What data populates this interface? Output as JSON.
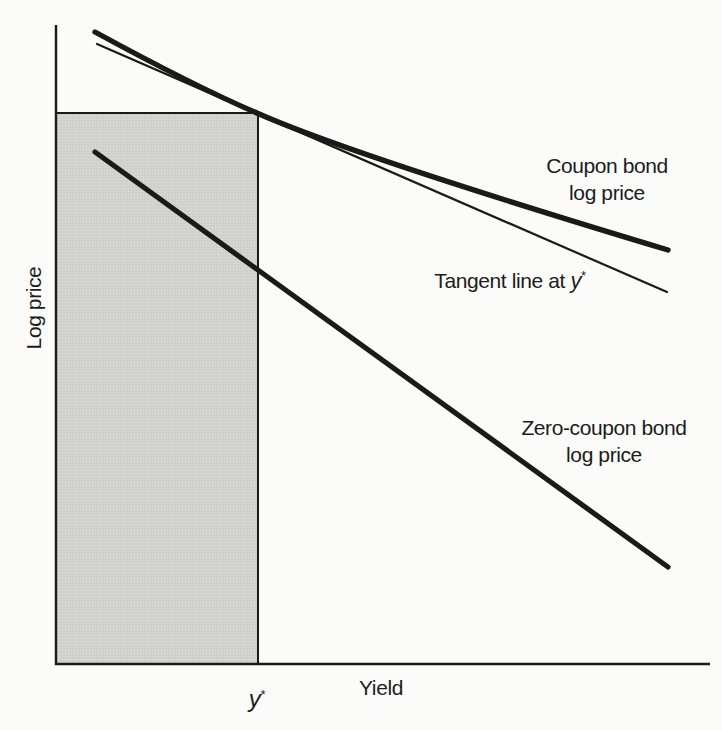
{
  "axis": {
    "y_label": "Log price",
    "x_label": "Yield"
  },
  "tick": {
    "var": "y",
    "sup": "*"
  },
  "annotations": {
    "coupon": {
      "line1": "Coupon bond",
      "line2": "log price"
    },
    "tangent": {
      "prefix": "Tangent line at ",
      "var": "y",
      "sup": "*"
    },
    "zero": {
      "line1": "Zero-coupon bond",
      "line2": "log price"
    }
  },
  "colors": {
    "ink": "#1a1a1a",
    "text": "#1c1c1c",
    "background": "#fbfbf9",
    "shade_fill": "#d6d6d3",
    "shade_dot": "#bdbdba"
  },
  "chart_data": {
    "type": "line",
    "title": "",
    "xlabel": "Yield",
    "ylabel": "Log price",
    "numeric_axes": false,
    "grid": false,
    "legend": "inline-annotations",
    "x_ticks": [
      {
        "label": "y*",
        "x_px": 258
      }
    ],
    "axes_px": {
      "origin": [
        56,
        664
      ],
      "y_top": 25,
      "x_right": 710,
      "stroke": 2.4
    },
    "shaded_region_px": {
      "x1": 56,
      "y1": 113,
      "x2": 258,
      "y2": 664,
      "edge_stroke": 2
    },
    "tangency_point_px": [
      258,
      113.5
    ],
    "series": [
      {
        "name": "Coupon bond log price",
        "kind": "convex_curve",
        "stroke_px": 5.4,
        "bezier_px": [
          [
            95,
            32
          ],
          [
            196,
            87
          ],
          [
            258,
            113.5
          ],
          [
            352,
            155
          ],
          [
            668,
            250
          ]
        ]
      },
      {
        "name": "Tangent line at y*",
        "kind": "straight",
        "stroke_px": 2.2,
        "points_px": [
          [
            97,
            44
          ],
          [
            667,
            292
          ]
        ]
      },
      {
        "name": "Zero-coupon bond log price",
        "kind": "straight",
        "stroke_px": 5.2,
        "points_px": [
          [
            95,
            152
          ],
          [
            668,
            567
          ]
        ]
      }
    ]
  }
}
